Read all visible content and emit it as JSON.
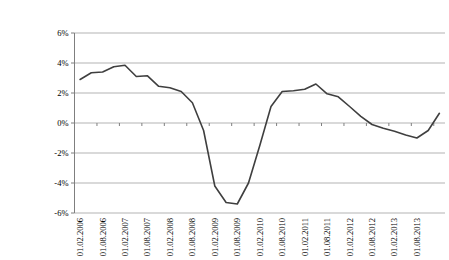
{
  "chart_data": {
    "type": "line",
    "title": "",
    "xlabel": "",
    "ylabel": "",
    "x": [
      "01.02.2006",
      "01.05.2006",
      "01.08.2006",
      "01.11.2006",
      "01.02.2007",
      "01.05.2007",
      "01.08.2007",
      "01.11.2007",
      "01.02.2008",
      "01.05.2008",
      "01.08.2008",
      "01.11.2008",
      "01.02.2009",
      "01.05.2009",
      "01.08.2009",
      "01.11.2009",
      "01.02.2010",
      "01.05.2010",
      "01.08.2010",
      "01.11.2010",
      "01.02.2011",
      "01.05.2011",
      "01.08.2011",
      "01.11.2011",
      "01.02.2012",
      "01.05.2012",
      "01.08.2012",
      "01.11.2012",
      "01.02.2013",
      "01.05.2013",
      "01.08.2013",
      "01.11.2013",
      "01.02.2014"
    ],
    "values": [
      2.9,
      3.35,
      3.4,
      3.75,
      3.85,
      3.1,
      3.15,
      2.45,
      2.35,
      2.1,
      1.35,
      -0.5,
      -4.2,
      -5.3,
      -5.4,
      -4.0,
      -1.5,
      1.1,
      2.1,
      2.15,
      2.25,
      2.6,
      1.95,
      1.75,
      1.1,
      0.45,
      -0.1,
      -0.35,
      -0.55,
      -0.8,
      -1.0,
      -0.5,
      0.65
    ],
    "x_tick_labels": [
      "01.02.2006",
      "01.08.2006",
      "01.02.2007",
      "01.08.2007",
      "01.02.2008",
      "01.08.2008",
      "01.02.2009",
      "01.08.2009",
      "01.02.2010",
      "01.08.2010",
      "01.02.2011",
      "01.08.2011",
      "01.02.2012",
      "01.08.2012",
      "01.02.2013",
      "01.08.2013"
    ],
    "label_every": 2,
    "y_ticks": [
      "6%",
      "4%",
      "2%",
      "0%",
      "-2%",
      "-4%",
      "-6%"
    ],
    "y_tick_values": [
      6,
      4,
      2,
      0,
      -2,
      -4,
      -6
    ],
    "ylim": [
      -6,
      6
    ],
    "grid": true,
    "legend_position": "none",
    "line_color": "#3f3f3f",
    "grid_color": "#b3b3b3",
    "axis_color": "#7f7f7f",
    "text_color": "#000000",
    "background_color": "#ffffff"
  }
}
